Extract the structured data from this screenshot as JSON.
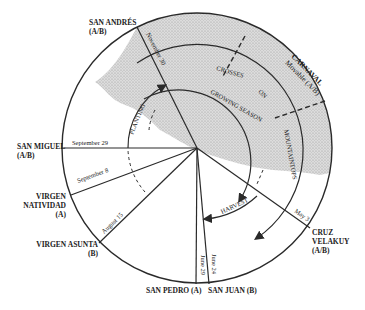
{
  "diagram": {
    "type": "ritual-agricultural-calendar-circle",
    "festivals": [
      {
        "name": "SAN ANDRÉS",
        "group": "(A/B)",
        "date": "November 30"
      },
      {
        "name": "CARNAVAL",
        "group": "Movable (A/B)",
        "date": ""
      },
      {
        "name": "SAN MIGUEL",
        "group": "(A/B)",
        "date": "September 29"
      },
      {
        "name": "VIRGEN NATIVIDAD",
        "group": "(A)",
        "date": "September 8"
      },
      {
        "name": "VIRGEN ASUNTA",
        "group": "(B)",
        "date": "August 15"
      },
      {
        "name": "SAN PEDRO",
        "group": "(A)",
        "date": "June 29"
      },
      {
        "name": "SAN JUAN",
        "group": "(B)",
        "date": "June 24"
      },
      {
        "name": "CRUZ VELAKUY",
        "group": "(A/B)",
        "date": "May 3"
      }
    ],
    "labels": {
      "san_andres": "SAN ANDRÉS",
      "san_andres_group": "(A/B)",
      "carnaval": "CARNAVAL",
      "carnaval_sub": "Movable (A/B)",
      "san_miguel": "SAN MIGUEL",
      "san_miguel_group": "(A/B)",
      "virgen_line1": "VIRGEN",
      "natividad": "NATIVIDAD",
      "natividad_group": "(A)",
      "virgen_asunta": "VIRGEN ASUNTA",
      "virgen_asunta_group": "(B)",
      "san_pedro": "SAN PEDRO (A)",
      "san_juan": "SAN JUAN (B)",
      "cruz": "CRUZ",
      "velakuy": "VELAKUY",
      "cruz_group": "(A/B)"
    },
    "dates": {
      "nov30": "November 30",
      "sep29": "September 29",
      "sep8": "September 8",
      "aug15": "August 15",
      "jun29": "June 29",
      "jun24": "June 24",
      "may3": "May 3"
    },
    "arc_labels": {
      "crosses": "CROSSES",
      "on": "ON",
      "mountaintops": "MOUNTAINTOPS",
      "growing_season": "GROWING SEASON",
      "planting": "PLANTING",
      "harvest": "HARVEST"
    },
    "colors": {
      "line": "#2a2a2a",
      "shade": "#cfcfcf",
      "background": "#ffffff"
    }
  }
}
